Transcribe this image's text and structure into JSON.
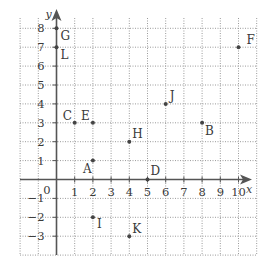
{
  "chart_data": {
    "type": "scatter",
    "title": "",
    "xlabel": "x",
    "ylabel": "y",
    "origin_label": "0",
    "xlim": [
      -2,
      11
    ],
    "ylim": [
      -4,
      8.5
    ],
    "grid": true,
    "x_ticks": [
      1,
      2,
      3,
      4,
      5,
      6,
      7,
      8,
      9,
      10
    ],
    "y_ticks": [
      8,
      7,
      6,
      5,
      4,
      3,
      2,
      1,
      -1,
      -2,
      -3
    ],
    "points": [
      {
        "label": "A",
        "x": 2,
        "y": 1
      },
      {
        "label": "B",
        "x": 8,
        "y": 3
      },
      {
        "label": "C",
        "x": 1,
        "y": 3
      },
      {
        "label": "D",
        "x": 5,
        "y": 0
      },
      {
        "label": "E",
        "x": 2,
        "y": 3
      },
      {
        "label": "F",
        "x": 10,
        "y": 7
      },
      {
        "label": "G",
        "x": 0,
        "y": 8
      },
      {
        "label": "H",
        "x": 4,
        "y": 2
      },
      {
        "label": "I",
        "x": 2,
        "y": -2
      },
      {
        "label": "J",
        "x": 6,
        "y": 4
      },
      {
        "label": "K",
        "x": 4,
        "y": -3
      },
      {
        "label": "L",
        "x": 0,
        "y": 7
      }
    ],
    "label_offsets": {
      "A": [
        -10,
        12
      ],
      "B": [
        3,
        12
      ],
      "C": [
        -12,
        -3
      ],
      "D": [
        3,
        -5
      ],
      "E": [
        -12,
        -3
      ],
      "F": [
        8,
        -3
      ],
      "G": [
        4,
        12
      ],
      "H": [
        3,
        -4
      ],
      "I": [
        4,
        11
      ],
      "J": [
        4,
        -4
      ],
      "K": [
        3,
        -3
      ],
      "L": [
        4,
        12
      ]
    }
  },
  "colors": {
    "axis": "#555555",
    "grid": "#9a9a9a",
    "point": "#444444",
    "text": "#3a3a3a"
  }
}
